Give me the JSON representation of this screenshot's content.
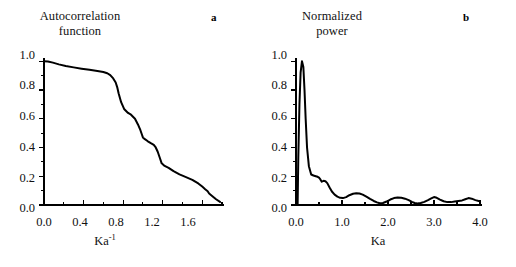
{
  "figure": {
    "background": "#ffffff",
    "line_color": "#000000",
    "axis_color": "#000000"
  },
  "panels": [
    {
      "letter": "a",
      "title_line1": "Autocorrelation",
      "title_line2": "function",
      "xaxis_label_base": "Ka",
      "xaxis_label_sup": "-1",
      "ylabels": [
        "1.0",
        "0.8",
        "0.6",
        "0.4",
        "0.2",
        "0.0"
      ],
      "xlabels": [
        "0.0",
        "0.4",
        "0.8",
        "1.2",
        "1.6"
      ]
    },
    {
      "letter": "b",
      "title_line1": "Normalized",
      "title_line2": "power",
      "xaxis_label_base": "Ka",
      "xaxis_label_sup": "",
      "ylabels": [
        "1.0",
        "0.8",
        "0.6",
        "0.4",
        "0.2",
        "0.0"
      ],
      "xlabels": [
        "0.0",
        "1.0",
        "2.0",
        "3.0",
        "4.0"
      ]
    }
  ],
  "chart_data": [
    {
      "type": "line",
      "panel": "a",
      "title": "Autocorrelation function",
      "xlabel": "Ka-1",
      "ylabel": "Autocorrelation function",
      "xlim": [
        0.0,
        1.8
      ],
      "ylim": [
        0.0,
        1.05
      ],
      "xticks": [
        0.0,
        0.4,
        0.8,
        1.2,
        1.6
      ],
      "yticks": [
        0.0,
        0.2,
        0.4,
        0.6,
        0.8,
        1.0
      ],
      "minor_ytick_step": 0.1,
      "minor_xtick_step": 0.2,
      "grid": false,
      "legend": null,
      "x": [
        0.0,
        0.04,
        0.09,
        0.15,
        0.22,
        0.3,
        0.38,
        0.46,
        0.54,
        0.6,
        0.64,
        0.67,
        0.7,
        0.725,
        0.74,
        0.755,
        0.78,
        0.81,
        0.85,
        0.88,
        0.92,
        0.95,
        0.975,
        0.99,
        1.0,
        1.02,
        1.05,
        1.08,
        1.11,
        1.13,
        1.15,
        1.17,
        1.19,
        1.22,
        1.26,
        1.31,
        1.37,
        1.43,
        1.5,
        1.56,
        1.6,
        1.63,
        1.655,
        1.67,
        1.7,
        1.74,
        1.78
      ],
      "y": [
        1.0,
        0.998,
        0.99,
        0.978,
        0.967,
        0.957,
        0.948,
        0.94,
        0.932,
        0.925,
        0.916,
        0.903,
        0.88,
        0.852,
        0.82,
        0.775,
        0.715,
        0.668,
        0.64,
        0.628,
        0.6,
        0.56,
        0.52,
        0.49,
        0.47,
        0.458,
        0.443,
        0.43,
        0.418,
        0.4,
        0.37,
        0.33,
        0.29,
        0.272,
        0.258,
        0.235,
        0.213,
        0.196,
        0.175,
        0.15,
        0.128,
        0.11,
        0.096,
        0.08,
        0.063,
        0.04,
        0.022
      ]
    },
    {
      "type": "line",
      "panel": "b",
      "title": "Normalized power",
      "xlabel": "Ka",
      "ylabel": "Normalized power",
      "xlim": [
        0.0,
        4.0
      ],
      "ylim": [
        0.0,
        1.05
      ],
      "xticks": [
        0.0,
        1.0,
        2.0,
        3.0,
        4.0
      ],
      "yticks": [
        0.0,
        0.2,
        0.4,
        0.6,
        0.8,
        1.0
      ],
      "minor_ytick_step": 0.1,
      "minor_xtick_step": 0.5,
      "grid": false,
      "legend": null,
      "x": [
        0.035,
        0.05,
        0.075,
        0.1,
        0.13,
        0.16,
        0.185,
        0.21,
        0.24,
        0.28,
        0.33,
        0.38,
        0.43,
        0.47,
        0.5,
        0.53,
        0.56,
        0.6,
        0.64,
        0.68,
        0.73,
        0.78,
        0.84,
        0.9,
        0.96,
        1.02,
        1.09,
        1.16,
        1.24,
        1.31,
        1.38,
        1.45,
        1.53,
        1.61,
        1.69,
        1.76,
        1.82,
        1.89,
        1.97,
        2.05,
        2.13,
        2.21,
        2.29,
        2.37,
        2.45,
        2.52,
        2.58,
        2.64,
        2.71,
        2.79,
        2.87,
        2.94,
        3.0,
        3.06,
        3.13,
        3.21,
        3.29,
        3.37,
        3.45,
        3.53,
        3.61,
        3.68,
        3.75,
        3.82,
        3.9,
        3.97,
        4.0
      ],
      "y": [
        0.0,
        0.33,
        0.7,
        0.92,
        1.0,
        0.96,
        0.8,
        0.6,
        0.4,
        0.27,
        0.212,
        0.205,
        0.2,
        0.196,
        0.19,
        0.178,
        0.162,
        0.168,
        0.165,
        0.152,
        0.122,
        0.094,
        0.072,
        0.058,
        0.05,
        0.048,
        0.055,
        0.068,
        0.078,
        0.082,
        0.08,
        0.072,
        0.058,
        0.042,
        0.028,
        0.018,
        0.012,
        0.014,
        0.024,
        0.038,
        0.048,
        0.052,
        0.05,
        0.044,
        0.034,
        0.022,
        0.014,
        0.011,
        0.014,
        0.022,
        0.034,
        0.046,
        0.055,
        0.05,
        0.038,
        0.026,
        0.02,
        0.02,
        0.024,
        0.028,
        0.032,
        0.04,
        0.048,
        0.044,
        0.034,
        0.028,
        0.026
      ]
    }
  ]
}
